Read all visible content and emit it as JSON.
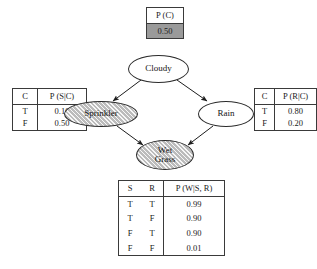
{
  "diagram": {
    "type": "bayesian-network"
  },
  "nodes": {
    "cloudy": {
      "label": "Cloudy",
      "shaded": false
    },
    "sprinkler": {
      "label": "Sprinkler",
      "shaded": true
    },
    "rain": {
      "label": "Rain",
      "shaded": false
    },
    "wetgrass": {
      "label_line1": "Wet",
      "label_line2": "Grass",
      "shaded": true
    }
  },
  "edges": [
    {
      "from": "Cloudy",
      "to": "Sprinkler"
    },
    {
      "from": "Cloudy",
      "to": "Rain"
    },
    {
      "from": "Sprinkler",
      "to": "Wet Grass"
    },
    {
      "from": "Rain",
      "to": "Wet Grass"
    }
  ],
  "tables": {
    "pc": {
      "header": "P (C)",
      "value": "0.50",
      "value_shaded": true
    },
    "psc": {
      "headers": [
        "C",
        "P (S|C)"
      ],
      "rows": [
        {
          "cond": "T",
          "value": "0.10"
        },
        {
          "cond": "F",
          "value": "0.50"
        }
      ]
    },
    "prc": {
      "headers": [
        "C",
        "P (R|C)"
      ],
      "rows": [
        {
          "cond": "T",
          "value": "0.80"
        },
        {
          "cond": "F",
          "value": "0.20"
        }
      ]
    },
    "pwsr": {
      "headers": [
        "S",
        "R",
        "P (W|S, R)"
      ],
      "rows": [
        {
          "s": "T",
          "r": "T",
          "value": "0.99"
        },
        {
          "s": "T",
          "r": "F",
          "value": "0.90"
        },
        {
          "s": "F",
          "r": "T",
          "value": "0.90"
        },
        {
          "s": "F",
          "r": "F",
          "value": "0.01"
        }
      ]
    }
  },
  "colors": {
    "shade_fill": "#9a9a9a",
    "evidence_fill": "#c8c8c8",
    "stroke": "#2b2b2b",
    "background": "#ffffff"
  }
}
